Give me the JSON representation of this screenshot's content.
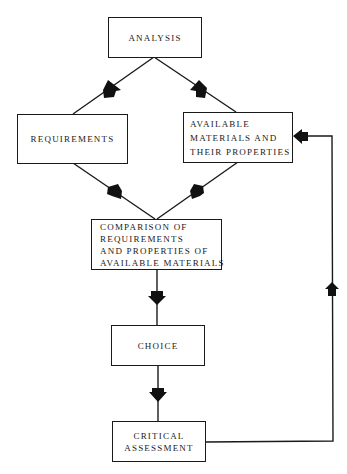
{
  "diagram": {
    "type": "flowchart",
    "nodes": [
      {
        "id": "analysis",
        "lines": [
          "ANALYSIS"
        ]
      },
      {
        "id": "requirements",
        "lines": [
          "REQUIREMENTS"
        ]
      },
      {
        "id": "available",
        "lines": [
          "AVAILABLE",
          "MATERIALS AND",
          "THEIR PROPERTIES"
        ]
      },
      {
        "id": "comparison",
        "lines": [
          "COMPARISON OF",
          "REQUIREMENTS",
          "AND PROPERTIES OF",
          "AVAILABLE MATERIALS"
        ]
      },
      {
        "id": "choice",
        "lines": [
          "CHOICE"
        ]
      },
      {
        "id": "critical",
        "lines": [
          "CRITICAL",
          "ASSESSMENT"
        ]
      }
    ],
    "edges": [
      {
        "from": "analysis",
        "to": "requirements"
      },
      {
        "from": "analysis",
        "to": "available"
      },
      {
        "from": "requirements",
        "to": "comparison"
      },
      {
        "from": "available",
        "to": "comparison"
      },
      {
        "from": "comparison",
        "to": "choice"
      },
      {
        "from": "choice",
        "to": "critical"
      },
      {
        "from": "critical",
        "to": "available",
        "style": "feedback-loop"
      }
    ],
    "colors": {
      "line": "#1a1a1a",
      "background": "#ffffff"
    }
  }
}
